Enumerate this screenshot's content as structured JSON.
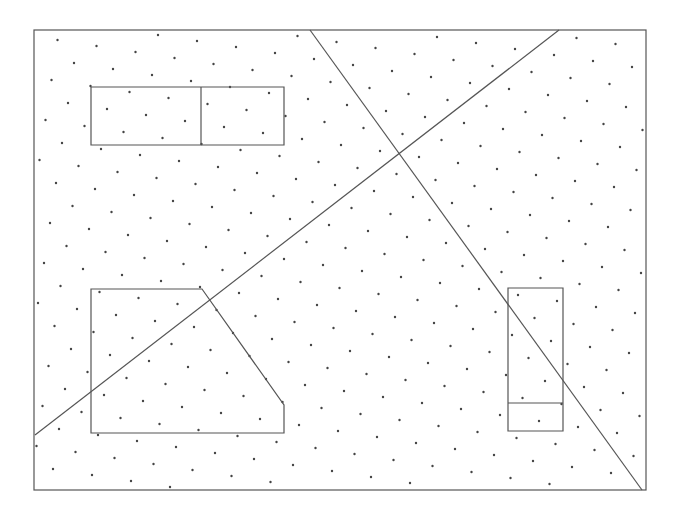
{
  "diagram": {
    "width": 680,
    "height": 522,
    "background": "#ffffff",
    "stroke_color": "#555555",
    "dot_color": "#444444",
    "frame": {
      "x1": 34,
      "y1": 30,
      "x2": 646,
      "y2": 490
    },
    "lines": [
      {
        "name": "diagonal-line-descending",
        "x1": 310,
        "y1": 30,
        "x2": 642,
        "y2": 490
      },
      {
        "name": "diagonal-line-ascending",
        "x1": 559,
        "y1": 30,
        "x2": 35,
        "y2": 435
      }
    ],
    "shapes": [
      {
        "name": "top-left-rectangle",
        "type": "polygon",
        "points": [
          [
            91,
            87
          ],
          [
            284,
            87
          ],
          [
            284,
            145
          ],
          [
            91,
            145
          ]
        ]
      },
      {
        "name": "top-left-rectangle-divider",
        "type": "line",
        "points": [
          [
            201,
            87
          ],
          [
            201,
            145
          ]
        ]
      },
      {
        "name": "bottom-left-pentagon",
        "type": "polygon",
        "points": [
          [
            91,
            289
          ],
          [
            202,
            289
          ],
          [
            284,
            405
          ],
          [
            284,
            433
          ],
          [
            91,
            433
          ]
        ]
      },
      {
        "name": "right-tall-rectangle",
        "type": "polygon",
        "points": [
          [
            508,
            288
          ],
          [
            563,
            288
          ],
          [
            563,
            431
          ],
          [
            508,
            431
          ]
        ]
      },
      {
        "name": "right-tall-rectangle-divider",
        "type": "line",
        "points": [
          [
            508,
            403
          ],
          [
            563,
            403
          ]
        ]
      }
    ],
    "dot_lattice": {
      "origin": [
        419,
        157
      ],
      "a": [
        39,
        6
      ],
      "b": [
        -22.5,
        17
      ],
      "radius": 1.2
    }
  }
}
